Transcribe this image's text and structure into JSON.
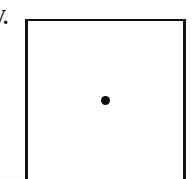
{
  "figure": {
    "canvas": {
      "width": 193,
      "height": 179,
      "background_color": "#fefefe"
    },
    "item_label": {
      "text": "V.",
      "note": "clipped at the left edge of the crop",
      "color": "#111111"
    },
    "box": {
      "name": "bounding-rectangle",
      "stroke_color": "#121212",
      "fill_color": "#ffffff",
      "left": 25,
      "top": 19,
      "width": 161,
      "border_left_px": 3,
      "border_right_px": 3,
      "border_top_px": 2,
      "bottom_clipped": true
    },
    "points": [
      {
        "name": "center-point",
        "x": 105,
        "y": 100,
        "diameter": 9,
        "color": "#0d0d0d"
      }
    ]
  }
}
